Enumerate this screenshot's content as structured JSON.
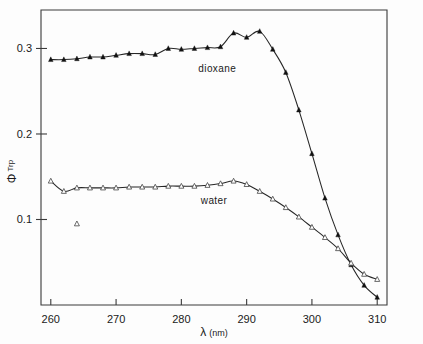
{
  "figure": {
    "background": "#fdfdfd",
    "ink_color": "#262626"
  },
  "chart_data": {
    "type": "line",
    "title": "",
    "xlabel": "λ (nm)",
    "xlabel_symbol": "λ",
    "xlabel_unit": "(nm)",
    "ylabel": "Φ Trp",
    "ylabel_symbol": "Φ",
    "ylabel_subscript": "Trp",
    "xlim": [
      258.5,
      311.5
    ],
    "ylim": [
      0.0,
      0.345
    ],
    "xticks": [
      260,
      270,
      280,
      290,
      300,
      310
    ],
    "xtick_labels": [
      "260",
      "270",
      "280",
      "290",
      "300",
      "310"
    ],
    "yticks": [
      0.1,
      0.2,
      0.3
    ],
    "ytick_labels": [
      "0.1",
      "0.2",
      "0.3"
    ],
    "grid": false,
    "legend_position": "inline-annotation",
    "annotations": [
      {
        "text": "dioxane",
        "x": 285.5,
        "y": 0.272
      },
      {
        "text": "water",
        "x": 285.0,
        "y": 0.118
      }
    ],
    "series": [
      {
        "name": "dioxane",
        "marker": "filled-triangle",
        "marker_color": "#111111",
        "line_color": "#262626",
        "x": [
          260,
          262,
          264,
          266,
          268,
          270,
          272,
          274,
          276,
          278,
          280,
          282,
          284,
          286,
          288,
          290,
          292,
          294,
          296,
          298,
          300,
          302,
          304,
          306,
          308,
          310
        ],
        "y": [
          0.287,
          0.287,
          0.288,
          0.29,
          0.29,
          0.292,
          0.294,
          0.294,
          0.293,
          0.3,
          0.299,
          0.3,
          0.301,
          0.302,
          0.318,
          0.313,
          0.32,
          0.299,
          0.272,
          0.228,
          0.177,
          0.125,
          0.082,
          0.047,
          0.023,
          0.009
        ]
      },
      {
        "name": "water",
        "marker": "open-triangle",
        "marker_color": "#ffffff",
        "line_color": "#3a3a3a",
        "x": [
          260,
          262,
          264,
          266,
          268,
          270,
          272,
          274,
          276,
          278,
          280,
          282,
          284,
          286,
          288,
          290,
          292,
          294,
          296,
          298,
          300,
          302,
          304,
          306,
          308,
          310
        ],
        "y": [
          0.145,
          0.133,
          0.137,
          0.137,
          0.137,
          0.137,
          0.138,
          0.138,
          0.138,
          0.139,
          0.139,
          0.139,
          0.14,
          0.142,
          0.145,
          0.141,
          0.133,
          0.124,
          0.114,
          0.103,
          0.091,
          0.079,
          0.066,
          0.049,
          0.036,
          0.03
        ]
      },
      {
        "name": "water-outlier",
        "marker": "open-triangle",
        "marker_color": "#ffffff",
        "line_color": "none",
        "x": [
          264
        ],
        "y": [
          0.095
        ]
      }
    ]
  }
}
